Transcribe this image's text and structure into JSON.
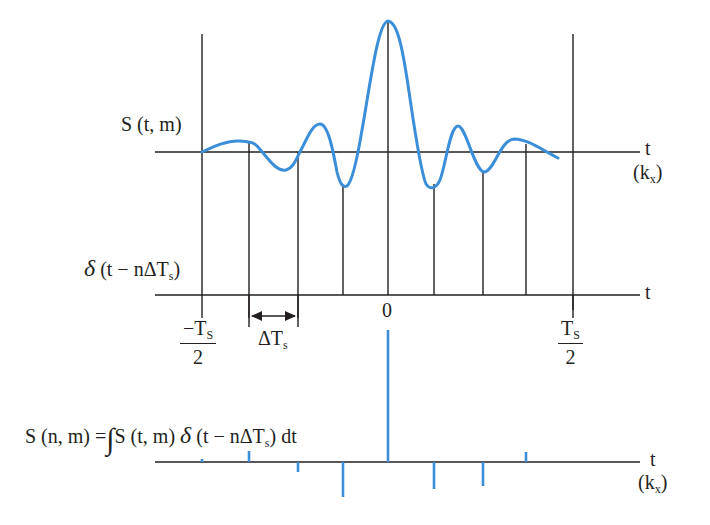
{
  "diagram": {
    "colors": {
      "signal": "#3a8fd8",
      "axes": "#231f20",
      "background": "#ffffff"
    },
    "top_panel": {
      "signal_label": "S (t, m)",
      "axis_label": "t",
      "axis_unit": "(k",
      "axis_unit_sub": "x",
      "axis_unit_close": ")"
    },
    "middle_panel": {
      "sampling_label_delta": "δ",
      "sampling_label_rest": " (t − nΔT",
      "sampling_label_sub": "s",
      "sampling_label_close": ")",
      "axis_label": "t",
      "origin_label": "0",
      "left_limit_num": "−T",
      "left_limit_num_sub": "S",
      "left_limit_den": "2",
      "right_limit_num": "T",
      "right_limit_num_sub": "S",
      "right_limit_den": "2",
      "interval_label": "ΔT",
      "interval_label_sub": "s"
    },
    "bottom_panel": {
      "equation_lhs": "S (n, m) =",
      "equation_integral": "∫",
      "equation_rhs_a": "S (t, m) ",
      "equation_rhs_delta": "δ",
      "equation_rhs_b": " (t − nΔT",
      "equation_rhs_sub": "s",
      "equation_rhs_c": ") dt",
      "axis_label": "t",
      "axis_unit": "(k",
      "axis_unit_sub": "x",
      "axis_unit_close": ")"
    },
    "samples": [
      {
        "n": -4,
        "x": 202,
        "value": 0.02
      },
      {
        "n": -3,
        "x": 249,
        "value": 0.1
      },
      {
        "n": -2,
        "x": 298,
        "value": -0.07
      },
      {
        "n": -1,
        "x": 343,
        "value": -0.25
      },
      {
        "n": 0,
        "x": 388,
        "value": 1.0
      },
      {
        "n": 1,
        "x": 434,
        "value": -0.21
      },
      {
        "n": 2,
        "x": 483,
        "value": -0.18
      },
      {
        "n": 3,
        "x": 526,
        "value": 0.08
      }
    ]
  }
}
